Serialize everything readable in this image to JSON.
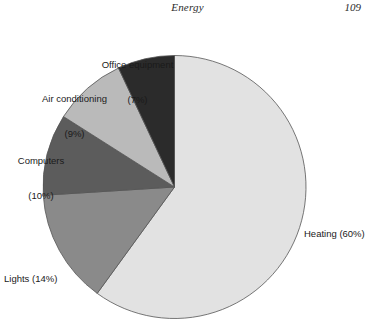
{
  "header": {
    "title": "Energy",
    "page_number": "109"
  },
  "chart_data": {
    "type": "pie",
    "title": "",
    "subtitle": "",
    "xlabel": "",
    "ylabel": "",
    "legend_position": "none",
    "grid": false,
    "start_angle_deg": 0,
    "direction": "clockwise",
    "unit": "%",
    "categories": [
      "Heating",
      "Lights",
      "Computers",
      "Air conditioning",
      "Office equipment"
    ],
    "values": [
      60,
      14,
      10,
      9,
      7
    ],
    "slices": [
      {
        "name": "Heating",
        "value": 60,
        "label_name": "Heating (60%)",
        "label_pct": "",
        "color": "#e2e2e2",
        "label_layout": "inline"
      },
      {
        "name": "Lights",
        "value": 14,
        "label_name": "Lights (14%)",
        "label_pct": "",
        "color": "#8a8a8a",
        "label_layout": "inline"
      },
      {
        "name": "Computers",
        "value": 10,
        "label_name": "Computers",
        "label_pct": "(10%)",
        "color": "#5c5c5c",
        "label_layout": "stacked"
      },
      {
        "name": "Air conditioning",
        "value": 9,
        "label_name": "Air conditioning",
        "label_pct": "(9%)",
        "color": "#bababa",
        "label_layout": "stacked"
      },
      {
        "name": "Office equipment",
        "value": 7,
        "label_name": "Office equipment",
        "label_pct": "(7%)",
        "color": "#2b2b2b",
        "label_layout": "stacked"
      }
    ],
    "outline_color": "#555555",
    "background_color": "#ffffff"
  }
}
